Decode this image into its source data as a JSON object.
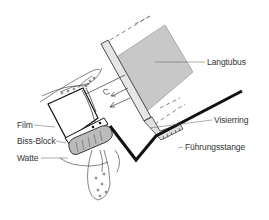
{
  "diagram": {
    "labels": {
      "langtubus": "Langtubus",
      "visierring": "Visierring",
      "fuehrungsstange": "Führungsstange",
      "film": "Film",
      "biss_block": "Biss-Block",
      "watte": "Watte"
    },
    "colors": {
      "tube_fill": "#c8c8c8",
      "ring_fill": "#e6e6e6",
      "line": "#1a1a1a",
      "leader": "#555555"
    }
  }
}
